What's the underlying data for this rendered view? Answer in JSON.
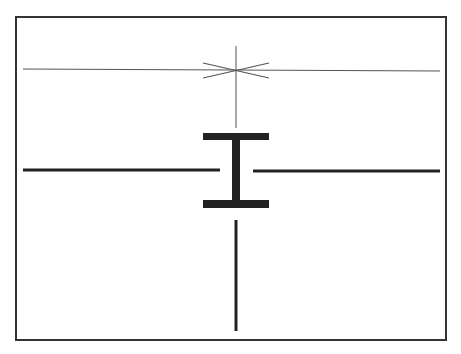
{
  "diagram": {
    "colors": {
      "background": "#ffffff",
      "frame": "#333333",
      "thin_line": "#555555",
      "thick_line": "#222222"
    },
    "frame": {
      "x": 16,
      "y": 17,
      "width": 430,
      "height": 323
    },
    "thin_horizontal": {
      "x1": 23,
      "y1": 69,
      "x2": 440,
      "y2": 71
    },
    "thin_vertical": {
      "x": 236,
      "y1": 46,
      "y2": 128
    },
    "asterisk_center": {
      "x": 236,
      "y": 70
    },
    "ibeam": {
      "x": 236,
      "top_y": 136,
      "bottom_y": 204,
      "bar_width": 66
    },
    "left_thick_line": {
      "x1": 23,
      "x2": 220,
      "y": 170
    },
    "right_thick_line": {
      "x1": 253,
      "x2": 440,
      "y": 171
    },
    "bottom_vertical": {
      "x": 236,
      "y1": 220,
      "y2": 331
    }
  }
}
